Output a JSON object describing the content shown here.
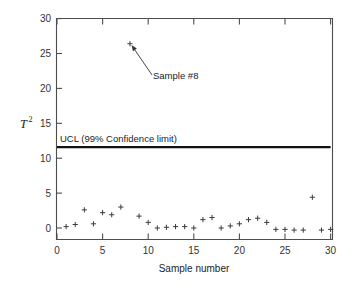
{
  "chart_data": {
    "type": "scatter",
    "title": "",
    "xlabel": "Sample number",
    "ylabel": "T2",
    "ylabel_base": "T",
    "ylabel_exp": "2",
    "xlim": [
      0,
      30
    ],
    "ylim": [
      0,
      30
    ],
    "xticks": [
      0,
      5,
      10,
      15,
      20,
      25,
      30
    ],
    "yticks": [
      0,
      5,
      10,
      15,
      20,
      25,
      30
    ],
    "xticklabels": [
      "0",
      "5",
      "10",
      "15",
      "20",
      "25",
      "30"
    ],
    "yticklabels": [
      "0",
      "5",
      "10",
      "15",
      "20",
      "25",
      "30"
    ],
    "grid": false,
    "legend": false,
    "marker": "plus",
    "marker_color": "#3b3b3b",
    "frame_color": "#4d4d4d",
    "x": [
      1,
      2,
      3,
      4,
      5,
      6,
      7,
      8,
      9,
      10,
      11,
      12,
      13,
      14,
      15,
      16,
      17,
      18,
      19,
      20,
      21,
      22,
      23,
      24,
      25,
      26,
      27,
      28,
      29,
      30
    ],
    "values": [
      0.2,
      0.5,
      2.6,
      0.6,
      2.2,
      1.9,
      3.0,
      26.4,
      1.7,
      0.8,
      0.0,
      0.1,
      0.2,
      0.2,
      0.0,
      1.2,
      1.5,
      0.0,
      0.3,
      0.6,
      1.2,
      1.4,
      0.8,
      -0.2,
      -0.2,
      -0.3,
      -0.3,
      4.4,
      -0.3,
      -0.2
    ],
    "series": [
      {
        "name": "T-squared statistic",
        "values": [
          0.2,
          0.5,
          2.6,
          0.6,
          2.2,
          1.9,
          3.0,
          26.4,
          1.7,
          0.8,
          0.0,
          0.1,
          0.2,
          0.2,
          0.0,
          1.2,
          1.5,
          0.0,
          0.3,
          0.6,
          1.2,
          1.4,
          0.8,
          -0.2,
          -0.2,
          -0.3,
          -0.3,
          4.4,
          -0.3,
          -0.2
        ]
      }
    ],
    "reference_lines": [
      {
        "name": "ucl",
        "label": "UCL (99% Confidence limit)",
        "value": 11.6,
        "x_start": 0,
        "x_end": 30,
        "color": "#111111"
      }
    ],
    "annotations": [
      {
        "name": "sample-8-callout",
        "text": "Sample #8",
        "target_x": 8,
        "target_y": 26.4
      }
    ]
  }
}
